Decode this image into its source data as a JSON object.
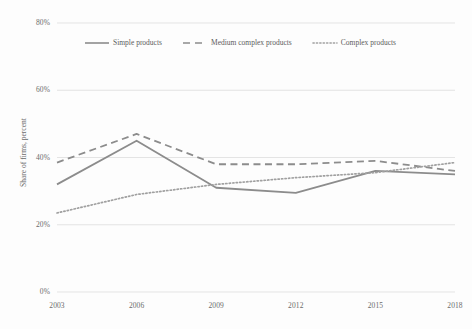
{
  "chart_data": {
    "type": "line",
    "title": "",
    "subtitle": "",
    "xlabel": "",
    "ylabel": "Share of firms, percent",
    "categories": [
      "2003",
      "2006",
      "2009",
      "2012",
      "2015",
      "2018"
    ],
    "x": [
      2003,
      2006,
      2009,
      2012,
      2015,
      2018
    ],
    "xlim": [
      2003,
      2018
    ],
    "ylim": [
      0,
      80
    ],
    "y_ticks": [
      0,
      20,
      40,
      60,
      80
    ],
    "y_tick_labels": [
      "0%",
      "20%",
      "40%",
      "60%",
      "80%"
    ],
    "x_tick_labels": [
      "2003",
      "2006",
      "2009",
      "2012",
      "2015",
      "2018"
    ],
    "grid": "horizontal",
    "legend_position": "top-inside",
    "series": [
      {
        "name": "Simple products",
        "style": "solid",
        "color": "#8c8c8c",
        "values": [
          32,
          45,
          31,
          29.5,
          36,
          35
        ]
      },
      {
        "name": "Medium complex products",
        "style": "dashed",
        "color": "#8c8c8c",
        "values": [
          38.5,
          47,
          38,
          38,
          39,
          36
        ]
      },
      {
        "name": "Complex products",
        "style": "dotted",
        "color": "#a0a0a0",
        "values": [
          23.5,
          29,
          32,
          34,
          35.5,
          38.5
        ]
      }
    ]
  },
  "axes": {
    "y_title": "Share of firms, percent",
    "y_labels": [
      "80%",
      "60%",
      "40%",
      "20%",
      "0%"
    ],
    "x_labels": [
      "2003",
      "2006",
      "2009",
      "2012",
      "2015",
      "2018"
    ]
  },
  "legend": {
    "items": [
      {
        "label": "Simple products",
        "style": "solid"
      },
      {
        "label": "Medium complex products",
        "style": "dashed"
      },
      {
        "label": "Complex products",
        "style": "dotted"
      }
    ]
  },
  "colors": {
    "line": "#8c8c8c",
    "dotted_line": "#a0a0a0",
    "grid": "#d8d8d8",
    "text": "#6b6b6b",
    "background": "#fdfdfd"
  }
}
